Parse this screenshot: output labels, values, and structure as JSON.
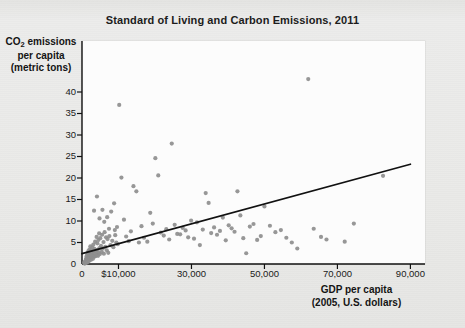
{
  "chart_data": {
    "type": "scatter",
    "title": "Standard of Living and Carbon Emissions, 2011",
    "xlabel": "GDP per capita\n(2005, U.S. dollars)",
    "ylabel": "CO₂ emissions\nper capita\n(metric tons)",
    "xlim": [
      0,
      94000
    ],
    "ylim": [
      0,
      43
    ],
    "grid": false,
    "legend": null,
    "x_ticks": [
      0,
      10000,
      30000,
      50000,
      70000,
      90000
    ],
    "x_tick_labels": [
      "0",
      "$10,000",
      "30,000",
      "50,000",
      "70,000",
      "90,000"
    ],
    "y_ticks": [
      0,
      5,
      10,
      15,
      20,
      25,
      30,
      35,
      40
    ],
    "y_tick_labels": [
      "0",
      "5",
      "10",
      "15",
      "20",
      "25",
      "30",
      "35",
      "40"
    ],
    "point_color": "#8e8e8e",
    "point_radius": 2.1,
    "trendline": {
      "type": "linear",
      "x": [
        0,
        90000
      ],
      "y": [
        2.4,
        23.2
      ],
      "color": "#111111",
      "width": 1.7
    },
    "points": [
      [
        600,
        0.3
      ],
      [
        700,
        0.1
      ],
      [
        800,
        0.5
      ],
      [
        900,
        0.2
      ],
      [
        1000,
        0.9
      ],
      [
        1050,
        0.4
      ],
      [
        1100,
        1.2
      ],
      [
        1200,
        0.6
      ],
      [
        1250,
        1.8
      ],
      [
        1300,
        0.3
      ],
      [
        1400,
        2.1
      ],
      [
        1450,
        0.8
      ],
      [
        1500,
        1.4
      ],
      [
        1550,
        2.6
      ],
      [
        1600,
        0.5
      ],
      [
        1700,
        1.1
      ],
      [
        1750,
        3.0
      ],
      [
        1800,
        1.9
      ],
      [
        1900,
        0.7
      ],
      [
        1950,
        2.3
      ],
      [
        2000,
        1.5
      ],
      [
        2050,
        3.4
      ],
      [
        2100,
        0.9
      ],
      [
        2200,
        2.8
      ],
      [
        2250,
        1.3
      ],
      [
        2300,
        4.1
      ],
      [
        2400,
        2.0
      ],
      [
        2500,
        1.0
      ],
      [
        2550,
        3.2
      ],
      [
        2600,
        2.5
      ],
      [
        2700,
        1.6
      ],
      [
        2800,
        3.8
      ],
      [
        2900,
        2.2
      ],
      [
        3000,
        1.2
      ],
      [
        3100,
        4.5
      ],
      [
        3200,
        2.9
      ],
      [
        3300,
        1.7
      ],
      [
        3400,
        3.5
      ],
      [
        3500,
        2.4
      ],
      [
        3600,
        5.2
      ],
      [
        3700,
        1.8
      ],
      [
        3800,
        3.1
      ],
      [
        3900,
        2.7
      ],
      [
        4000,
        6.3
      ],
      [
        4100,
        2.1
      ],
      [
        4200,
        4.8
      ],
      [
        4300,
        3.3
      ],
      [
        4400,
        1.9
      ],
      [
        4500,
        5.6
      ],
      [
        4600,
        2.6
      ],
      [
        4700,
        7.1
      ],
      [
        4800,
        3.7
      ],
      [
        4900,
        2.3
      ],
      [
        5000,
        6.0
      ],
      [
        5200,
        4.2
      ],
      [
        5400,
        2.8
      ],
      [
        5500,
        6.8
      ],
      [
        5700,
        3.6
      ],
      [
        5900,
        5.1
      ],
      [
        6000,
        2.4
      ],
      [
        6200,
        7.4
      ],
      [
        6400,
        4.0
      ],
      [
        6600,
        6.2
      ],
      [
        6800,
        3.2
      ],
      [
        7000,
        5.8
      ],
      [
        7200,
        2.6
      ],
      [
        7500,
        6.5
      ],
      [
        7800,
        4.4
      ],
      [
        8000,
        12.2
      ],
      [
        8300,
        5.4
      ],
      [
        8600,
        3.9
      ],
      [
        9000,
        7.9
      ],
      [
        9400,
        5.0
      ],
      [
        9800,
        4.6
      ],
      [
        3300,
        12.4
      ],
      [
        4100,
        15.7
      ],
      [
        4800,
        10.6
      ],
      [
        5600,
        12.6
      ],
      [
        6100,
        9.8
      ],
      [
        6900,
        10.9
      ],
      [
        7400,
        8.2
      ],
      [
        8800,
        14.1
      ],
      [
        9100,
        6.7
      ],
      [
        9600,
        8.6
      ],
      [
        10200,
        37.0
      ],
      [
        10800,
        20.1
      ],
      [
        11500,
        10.3
      ],
      [
        12100,
        6.4
      ],
      [
        12800,
        5.3
      ],
      [
        13400,
        7.6
      ],
      [
        14100,
        18.1
      ],
      [
        14900,
        16.9
      ],
      [
        15600,
        5.0
      ],
      [
        16300,
        8.8
      ],
      [
        17000,
        6.1
      ],
      [
        17900,
        5.2
      ],
      [
        18700,
        11.9
      ],
      [
        19400,
        9.4
      ],
      [
        20100,
        24.6
      ],
      [
        20900,
        20.6
      ],
      [
        21600,
        7.3
      ],
      [
        22400,
        6.6
      ],
      [
        23100,
        8.1
      ],
      [
        23900,
        5.7
      ],
      [
        24600,
        28.0
      ],
      [
        25400,
        9.1
      ],
      [
        26100,
        7.0
      ],
      [
        26900,
        6.9
      ],
      [
        27600,
        8.4
      ],
      [
        28400,
        7.8
      ],
      [
        29100,
        6.2
      ],
      [
        29900,
        10.1
      ],
      [
        30700,
        5.9
      ],
      [
        31500,
        9.7
      ],
      [
        32300,
        4.4
      ],
      [
        33100,
        8.0
      ],
      [
        33900,
        16.5
      ],
      [
        34700,
        14.2
      ],
      [
        35400,
        7.2
      ],
      [
        36200,
        8.5
      ],
      [
        37000,
        6.8
      ],
      [
        37800,
        7.7
      ],
      [
        38600,
        10.8
      ],
      [
        39400,
        5.5
      ],
      [
        40200,
        9.0
      ],
      [
        41000,
        8.3
      ],
      [
        41800,
        7.5
      ],
      [
        42600,
        16.9
      ],
      [
        43400,
        11.3
      ],
      [
        44200,
        6.0
      ],
      [
        45000,
        2.5
      ],
      [
        46000,
        8.7
      ],
      [
        47000,
        9.3
      ],
      [
        48000,
        5.6
      ],
      [
        49000,
        6.5
      ],
      [
        50000,
        13.4
      ],
      [
        51500,
        8.9
      ],
      [
        53000,
        7.4
      ],
      [
        54500,
        7.9
      ],
      [
        56000,
        6.1
      ],
      [
        57500,
        5.0
      ],
      [
        59000,
        3.6
      ],
      [
        62000,
        43.0
      ],
      [
        63500,
        8.2
      ],
      [
        65500,
        6.3
      ],
      [
        67000,
        5.7
      ],
      [
        72000,
        5.2
      ],
      [
        74500,
        9.4
      ],
      [
        82500,
        20.5
      ]
    ]
  }
}
